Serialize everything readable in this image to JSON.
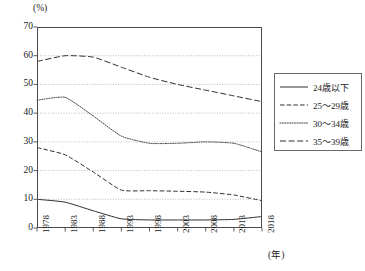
{
  "chart_data": {
    "type": "line",
    "title": "",
    "xlabel": "(年)",
    "ylabel": "(%)",
    "ylim": [
      0,
      70
    ],
    "ytick_labels": [
      "0",
      "10",
      "20",
      "30",
      "40",
      "50",
      "60",
      "70"
    ],
    "ytick_values": [
      0,
      10,
      20,
      30,
      40,
      50,
      60,
      70
    ],
    "grid": "horizontal-dotted",
    "legend_position": "right",
    "categories": [
      1978,
      1983,
      1988,
      1993,
      1998,
      2003,
      2008,
      2013,
      2018
    ],
    "xtick_labels": [
      "1978",
      "1983",
      "1988",
      "1993",
      "1998",
      "2003",
      "2008",
      "2013",
      "2018"
    ],
    "series": [
      {
        "name": "24歳以下",
        "style": "solid",
        "values": [
          10.0,
          9.0,
          6.0,
          3.2,
          2.8,
          2.8,
          2.8,
          3.0,
          4.0
        ]
      },
      {
        "name": "25〜29歳",
        "style": "dashed",
        "values": [
          28.0,
          25.5,
          19.5,
          13.2,
          13.0,
          12.8,
          12.5,
          11.5,
          9.5
        ]
      },
      {
        "name": "30〜34歳",
        "style": "dotted",
        "values": [
          44.5,
          45.5,
          39.0,
          32.0,
          29.5,
          29.5,
          30.0,
          29.5,
          26.5
        ]
      },
      {
        "name": "35〜39歳",
        "style": "longdash",
        "values": [
          58.0,
          60.0,
          59.5,
          56.0,
          52.5,
          50.0,
          48.0,
          46.0,
          44.0
        ]
      }
    ]
  },
  "axis": {
    "y_unit": "(%)",
    "x_unit": "(年)"
  },
  "legend": {
    "items": [
      {
        "label": "24歳以下",
        "style": "solid"
      },
      {
        "label": "25〜29歳",
        "style": "dashed"
      },
      {
        "label": "30〜34歳",
        "style": "dotted"
      },
      {
        "label": "35〜39歳",
        "style": "longdash"
      }
    ]
  }
}
